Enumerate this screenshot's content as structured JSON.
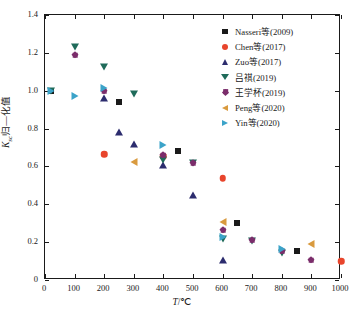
{
  "chart_data": {
    "type": "scatter",
    "title": "",
    "xlabel": "T/℃",
    "ylabel": "Ksc归一化值",
    "xlim": [
      0,
      1000
    ],
    "ylim": [
      0,
      1.4
    ],
    "xticks": [
      0,
      100,
      200,
      300,
      400,
      500,
      600,
      700,
      800,
      900,
      1000
    ],
    "xticklabels": [
      "0",
      "100",
      "200",
      "300",
      "400",
      "500",
      "600",
      "700",
      "800",
      "900",
      "1000"
    ],
    "yticks": [
      0,
      0.2,
      0.4,
      0.6,
      0.8,
      1.0,
      1.2,
      1.4
    ],
    "yticklabels": [
      "0",
      "0.2",
      "0.4",
      "0.6",
      "0.8",
      "1.0",
      "1.2",
      "1.4"
    ],
    "grid": false,
    "legend_position": "upper-right",
    "series": [
      {
        "name": "Nasseri等(2009)",
        "marker": "square",
        "color": "#1a1a1a",
        "points": [
          [
            20,
            1.0
          ],
          [
            250,
            0.94
          ],
          [
            450,
            0.68
          ],
          [
            650,
            0.3
          ],
          [
            850,
            0.152
          ]
        ]
      },
      {
        "name": "Chen等(2017)",
        "marker": "circle",
        "color": "#e8452c",
        "points": [
          [
            200,
            0.665
          ],
          [
            400,
            0.655
          ],
          [
            600,
            0.538
          ],
          [
            1000,
            0.1
          ]
        ]
      },
      {
        "name": "Zuo等(2017)",
        "marker": "triangle-up",
        "color": "#2c2c6e",
        "points": [
          [
            200,
            0.962
          ],
          [
            250,
            0.78
          ],
          [
            300,
            0.72
          ],
          [
            400,
            0.608
          ],
          [
            500,
            0.447
          ],
          [
            600,
            0.108
          ]
        ]
      },
      {
        "name": "吕祺(2019)",
        "marker": "triangle-down",
        "color": "#1f6b5a",
        "points": [
          [
            20,
            1.0
          ],
          [
            100,
            1.232
          ],
          [
            200,
            1.127
          ],
          [
            300,
            0.983
          ],
          [
            400,
            0.632
          ],
          [
            500,
            0.618
          ],
          [
            600,
            0.218
          ],
          [
            700,
            0.208
          ],
          [
            800,
            0.142
          ]
        ]
      },
      {
        "name": "王学杯(2019)",
        "marker": "diamond",
        "color": "#7b2d6b",
        "points": [
          [
            100,
            1.19
          ],
          [
            200,
            1.0
          ],
          [
            400,
            0.662
          ],
          [
            500,
            0.618
          ],
          [
            600,
            0.265
          ],
          [
            700,
            0.213
          ],
          [
            800,
            0.155
          ],
          [
            900,
            0.108
          ]
        ]
      },
      {
        "name": "Peng等(2020)",
        "marker": "triangle-left",
        "color": "#d99a3e",
        "points": [
          [
            300,
            0.625
          ],
          [
            600,
            0.308
          ],
          [
            900,
            0.19
          ]
        ]
      },
      {
        "name": "Yin等(2020)",
        "marker": "triangle-right",
        "color": "#3ba3c9",
        "points": [
          [
            20,
            1.0
          ],
          [
            100,
            0.972
          ],
          [
            200,
            1.012
          ],
          [
            400,
            0.712
          ],
          [
            600,
            0.228
          ],
          [
            800,
            0.162
          ]
        ]
      }
    ]
  }
}
